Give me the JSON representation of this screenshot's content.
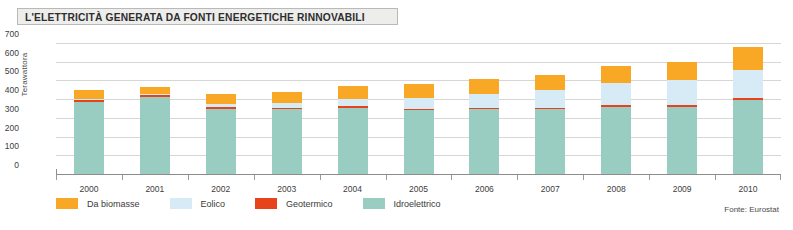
{
  "title": "L'ELETTRICITÀ GENERATA DA FONTI ENERGETICHE RINNOVABILI",
  "source": "Fonte: Eurostat",
  "colors": {
    "biomass": "#F9A825",
    "wind": "#D6EBF5",
    "geothermal": "#E8441B",
    "hydro": "#9ACDC2",
    "grid": "#d6d6d4",
    "axis": "#8d8d8b",
    "title_box_bg": "#ededec",
    "title_box_border": "#b9b9b7"
  },
  "chart_data": {
    "type": "bar",
    "stacked": true,
    "title": "L'ELETTRICITÀ GENERATA DA FONTI ENERGETICHE RINNOVABILI",
    "xlabel": "",
    "ylabel": "Terawattora",
    "ylim": [
      0,
      700
    ],
    "yticks": [
      0,
      100,
      200,
      300,
      400,
      500,
      600,
      700
    ],
    "ytick_labels": [
      "0",
      "100",
      "200",
      "300",
      "400",
      "500",
      "600",
      "700"
    ],
    "grid": true,
    "legend_position": "bottom-left",
    "categories": [
      "2000",
      "2001",
      "2002",
      "2003",
      "2004",
      "2005",
      "2006",
      "2007",
      "2008",
      "2009",
      "2010"
    ],
    "series": [
      {
        "name": "Idroelettrico",
        "color": "#9ACDC2",
        "values": [
          385,
          412,
          350,
          345,
          355,
          340,
          345,
          345,
          360,
          360,
          395
        ]
      },
      {
        "name": "Geotermico",
        "color": "#E8441B",
        "values": [
          10,
          10,
          10,
          10,
          10,
          10,
          10,
          10,
          10,
          10,
          12
        ]
      },
      {
        "name": "Eolico",
        "color": "#D6EBF5",
        "values": [
          6,
          8,
          15,
          22,
          35,
          55,
          70,
          95,
          115,
          130,
          150
        ]
      },
      {
        "name": "Da biomasse",
        "color": "#F9A825",
        "values": [
          49,
          35,
          55,
          60,
          70,
          75,
          85,
          80,
          90,
          100,
          120
        ]
      }
    ],
    "totals": [
      450,
      465,
      430,
      437,
      470,
      480,
      510,
      530,
      575,
      600,
      677
    ],
    "annotations": [
      "Fonte: Eurostat"
    ]
  },
  "legend": [
    {
      "label": "Da biomasse",
      "color": "#F9A825",
      "icon": "legend-swatch-biomass"
    },
    {
      "label": "Eolico",
      "color": "#D6EBF5",
      "icon": "legend-swatch-wind"
    },
    {
      "label": "Geotermico",
      "color": "#E8441B",
      "icon": "legend-swatch-geothermal"
    },
    {
      "label": "Idroelettrico",
      "color": "#9ACDC2",
      "icon": "legend-swatch-hydro"
    }
  ]
}
